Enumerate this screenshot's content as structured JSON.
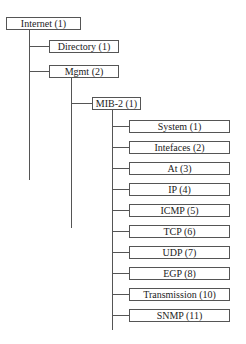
{
  "diagram": {
    "type": "tree",
    "root": {
      "label": "Internet (1)",
      "children": [
        {
          "label": "Directory (1)"
        },
        {
          "label": "Mgmt (2)",
          "children": [
            {
              "label": "MIB-2 (1)",
              "children": [
                {
                  "label": "System (1)"
                },
                {
                  "label": "Intefaces (2)"
                },
                {
                  "label": "At (3)"
                },
                {
                  "label": "IP (4)"
                },
                {
                  "label": "ICMP (5)"
                },
                {
                  "label": "TCP (6)"
                },
                {
                  "label": "UDP (7)"
                },
                {
                  "label": "EGP (8)"
                },
                {
                  "label": "Transmission (10)"
                },
                {
                  "label": "SNMP (11)"
                }
              ]
            }
          ]
        }
      ]
    }
  },
  "nodes": {
    "internet": "Internet (1)",
    "directory": "Directory (1)",
    "mgmt": "Mgmt (2)",
    "mib2": "MIB-2 (1)",
    "leaves": [
      "System (1)",
      "Intefaces (2)",
      "At (3)",
      "IP (4)",
      "ICMP (5)",
      "TCP (6)",
      "UDP (7)",
      "EGP (8)",
      "Transmission (10)",
      "SNMP (11)"
    ]
  },
  "colors": {
    "line": "#555555",
    "box_border": "#555555",
    "background": "#ffffff"
  }
}
